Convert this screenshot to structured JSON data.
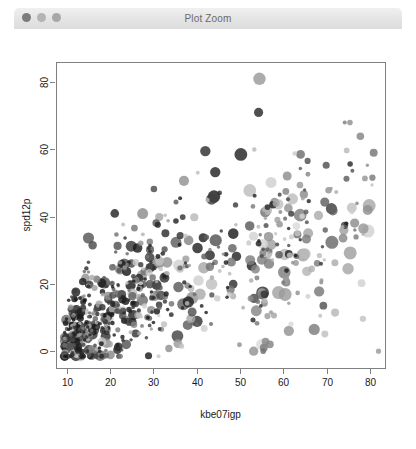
{
  "window": {
    "title": "Plot Zoom",
    "controls": [
      {
        "name": "close",
        "color": "#7c7c7c"
      },
      {
        "name": "minimize",
        "color": "#b4b4b4"
      },
      {
        "name": "maximize",
        "color": "#a8a8a8"
      }
    ]
  },
  "chart_data": {
    "type": "scatter",
    "title": "",
    "xlabel": "kbe07igp",
    "ylabel": "spd12p",
    "xlim": [
      7.5,
      83.5
    ],
    "ylim": [
      -5,
      86
    ],
    "xticks": [
      10,
      20,
      30,
      40,
      50,
      60,
      70,
      80
    ],
    "yticks": [
      0,
      20,
      40,
      60,
      80
    ],
    "xtick_labels": [
      "10",
      "20",
      "30",
      "40",
      "50",
      "60",
      "70",
      "80"
    ],
    "ytick_labels": [
      "0",
      "20",
      "40",
      "60",
      "80"
    ],
    "grid": false,
    "legend": null,
    "point_style": {
      "marker": "circle",
      "min_radius": 1.6,
      "max_radius": 6.5,
      "color_min": "#1a1a1a",
      "color_max": "#dcdcdc",
      "alpha": "varied"
    },
    "n_points": 430,
    "notable_points": [
      {
        "x": 54.5,
        "y": 81.0,
        "r": 6.2,
        "shade": "#9a9a9a"
      },
      {
        "x": 54.3,
        "y": 71.0,
        "r": 4.6,
        "shade": "#2a2a2a"
      },
      {
        "x": 50.2,
        "y": 58.5,
        "r": 6.4,
        "shade": "#242424"
      },
      {
        "x": 42.0,
        "y": 59.5,
        "r": 5.2,
        "shade": "#2e2e2e"
      },
      {
        "x": 79.5,
        "y": 42.0,
        "r": 5.0,
        "shade": "#8f8f8f"
      },
      {
        "x": 74.0,
        "y": 36.0,
        "r": 4.6,
        "shade": "#a0a0a0"
      },
      {
        "x": 78.5,
        "y": 36.5,
        "r": 5.2,
        "shade": "#989898"
      },
      {
        "x": 64.0,
        "y": 58.5,
        "r": 4.4,
        "shade": "#6e6e6e"
      },
      {
        "x": 36.5,
        "y": 1.5,
        "r": 2.6,
        "shade": "#c2c2c2"
      }
    ],
    "seed": 20240517
  }
}
